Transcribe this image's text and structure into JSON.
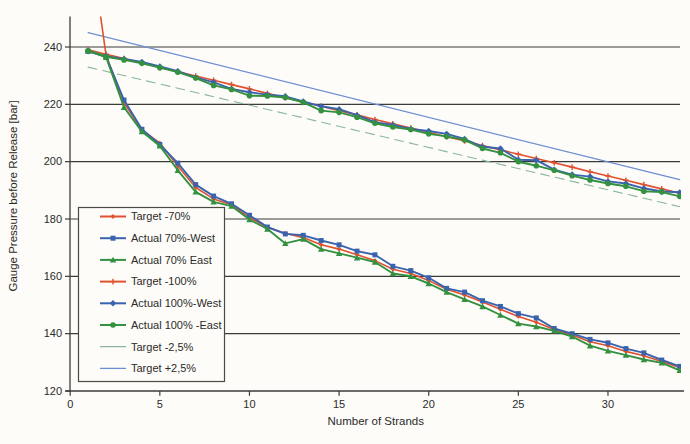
{
  "page": {
    "background": "#fdfcf9",
    "grid_color": "#3b3b39",
    "axis_color": "#3b3b39",
    "text_color": "#2b2b28"
  },
  "chart_data": {
    "type": "line",
    "title": "",
    "xlabel": "Number of Strands",
    "ylabel": "Gauge Pressure before Release [bar]",
    "xlim": [
      0,
      34
    ],
    "ylim": [
      120,
      250
    ],
    "x_ticks": [
      0,
      5,
      10,
      15,
      20,
      25,
      30
    ],
    "y_ticks": [
      120,
      140,
      160,
      180,
      200,
      220,
      240
    ],
    "grid": "horizontal",
    "legend_position": "middle-left",
    "legend_border": true,
    "x": [
      1,
      2,
      3,
      4,
      5,
      6,
      7,
      8,
      9,
      10,
      11,
      12,
      13,
      14,
      15,
      16,
      17,
      18,
      19,
      20,
      21,
      22,
      23,
      24,
      25,
      26,
      27,
      28,
      29,
      30,
      31,
      32,
      33,
      34
    ],
    "series": [
      {
        "name": "Target -70%",
        "color": "#e0512f",
        "marker": "diamond-small",
        "width": 1.6,
        "values": [
          282,
          237,
          220.5,
          211,
          206.5,
          198.5,
          191,
          187,
          185,
          180.5,
          177,
          175,
          173.5,
          171,
          169.5,
          167.5,
          165.5,
          162.5,
          161,
          158.5,
          155.5,
          153.5,
          151,
          148.5,
          146,
          144,
          141.5,
          139.5,
          137.2,
          135.8,
          133.8,
          132.3,
          130.3,
          128.2
        ]
      },
      {
        "name": "Actual 70%-West",
        "color": "#3b63ad",
        "marker": "square",
        "width": 1.9,
        "values": [
          238.5,
          236.6,
          221.5,
          211.3,
          206,
          199.5,
          192,
          188,
          185.3,
          181.3,
          177.2,
          174.8,
          174.3,
          172.5,
          171,
          168.8,
          167.5,
          163.5,
          162,
          159.5,
          155.8,
          154.5,
          151.5,
          149.5,
          147,
          145.5,
          141.8,
          140,
          138,
          136.8,
          134.8,
          133.3,
          130.8,
          128.6
        ]
      },
      {
        "name": "Actual 70% East",
        "color": "#33913f",
        "marker": "triangle",
        "width": 1.9,
        "values": [
          238.7,
          236.4,
          219,
          210.5,
          205.5,
          197,
          189.5,
          186,
          184.5,
          179.8,
          176.5,
          171.5,
          173,
          169.5,
          168,
          166.5,
          165,
          161,
          160,
          157.5,
          154.5,
          152,
          149.5,
          146.5,
          143.5,
          142.5,
          141,
          139,
          135.8,
          134,
          132.5,
          131,
          129.8,
          127.2
        ]
      },
      {
        "name": "Target -100%",
        "color": "#e0512f",
        "marker": "plus",
        "width": 1.6,
        "values": [
          239,
          237.5,
          236,
          234.5,
          232.9,
          231.4,
          229.9,
          228.4,
          226.9,
          225.4,
          223.8,
          222.3,
          220.8,
          219.3,
          217.8,
          216.3,
          214.7,
          213.2,
          211.7,
          210.2,
          208.7,
          207.2,
          205.6,
          204.1,
          202.6,
          201.1,
          199.6,
          198.1,
          196.5,
          195,
          193.5,
          192,
          190.5,
          189
        ]
      },
      {
        "name": "Actual 100%-West",
        "color": "#3b63ad",
        "marker": "diamond",
        "width": 1.9,
        "values": [
          238.5,
          236.8,
          235.8,
          234.8,
          233.2,
          231.6,
          229.4,
          227.7,
          225.4,
          224.2,
          223.4,
          222.8,
          221,
          219.3,
          218.3,
          216.2,
          213.8,
          212.8,
          211.4,
          210.7,
          209.7,
          207.9,
          205.2,
          204.6,
          200.7,
          200.5,
          197.2,
          195.5,
          194.8,
          193.1,
          192.4,
          190.7,
          189.6,
          189.3
        ]
      },
      {
        "name": "Actual 100% -East",
        "color": "#33913f",
        "marker": "circle",
        "width": 1.9,
        "values": [
          238.7,
          236.6,
          235.5,
          234.3,
          232.8,
          231.2,
          229.2,
          226.6,
          225.2,
          223,
          222.9,
          222.4,
          220.7,
          217.8,
          217.2,
          215.5,
          213.4,
          212.1,
          211.2,
          209.7,
          208.8,
          207.6,
          204.6,
          203.1,
          200,
          198.6,
          197,
          195.1,
          193.6,
          192.4,
          191.4,
          189.7,
          189.4,
          187.9
        ]
      },
      {
        "name": "Target -2,5%",
        "color": "#8ab79a",
        "marker": "none",
        "width": 1.1,
        "dash": "9,6",
        "x": [
          1,
          34
        ],
        "values": [
          233,
          184.3
        ]
      },
      {
        "name": "Target +2,5%",
        "color": "#6c8fd4",
        "marker": "none",
        "width": 1.2,
        "x": [
          1,
          34
        ],
        "values": [
          245,
          193.7
        ]
      }
    ]
  }
}
